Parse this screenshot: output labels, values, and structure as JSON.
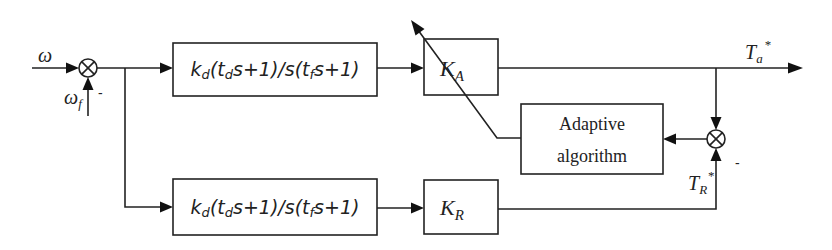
{
  "diagram": {
    "type": "control block diagram",
    "inputs": {
      "reference": {
        "symbol": "ω",
        "sub": ""
      },
      "feedback": {
        "symbol": "ω",
        "sub": "f",
        "sign": "-"
      }
    },
    "blocks": {
      "controller_top": {
        "text_parts": [
          "k",
          "d",
          "(t",
          "d",
          "s+1)/s(t",
          "f",
          "s+1)"
        ]
      },
      "gain_a": {
        "symbol": "K",
        "sub": "A"
      },
      "adaptive": {
        "line1": "Adaptive",
        "line2": "algorithm"
      },
      "controller_bottom": {
        "text_parts": [
          "k",
          "d",
          "(t",
          "d",
          "s+1)/s(t",
          "f",
          "s+1)"
        ]
      },
      "gain_r": {
        "symbol": "K",
        "sub": "R"
      }
    },
    "signals": {
      "output_a": {
        "symbol": "T",
        "sub": "a",
        "sup": "*"
      },
      "output_r": {
        "symbol": "T",
        "sub": "R",
        "sup": "*",
        "sign": "-"
      }
    }
  }
}
